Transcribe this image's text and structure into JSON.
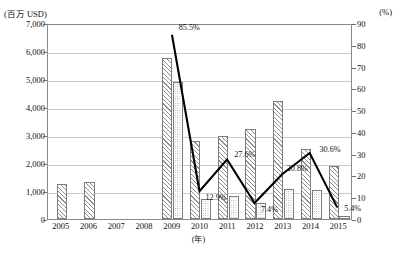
{
  "chart_data": {
    "type": "bar",
    "title": "",
    "subtitle": "",
    "xlabel": "(年)",
    "ylabel": "(百万 USD)",
    "y2label": "(%)",
    "categories": [
      "2005",
      "2006",
      "2007",
      "2008",
      "2009",
      "2010",
      "2011",
      "2012",
      "2013",
      "2014",
      "2015"
    ],
    "ylim": [
      0,
      7000
    ],
    "yticks": [
      "0",
      "1,000",
      "2,000",
      "3,000",
      "4,000",
      "5,000",
      "6,000",
      "7,000"
    ],
    "ytick_values": [
      0,
      1000,
      2000,
      3000,
      4000,
      5000,
      6000,
      7000
    ],
    "y2lim": [
      0,
      90
    ],
    "y2ticks": [
      "0",
      "10",
      "20",
      "30",
      "40",
      "50",
      "60",
      "70",
      "80",
      "90"
    ],
    "y2tick_values": [
      0,
      10,
      20,
      30,
      40,
      50,
      60,
      70,
      80,
      90
    ],
    "grid": true,
    "legend_position": "none",
    "series": [
      {
        "name": "bar-hatched",
        "kind": "bar",
        "axis": "left",
        "pattern": "diagonal-hatch",
        "values": [
          1250,
          1330,
          null,
          null,
          5750,
          2800,
          2960,
          3200,
          4200,
          2500,
          1900
        ]
      },
      {
        "name": "bar-dotted",
        "kind": "bar",
        "axis": "left",
        "pattern": "dotted",
        "values": [
          null,
          null,
          null,
          null,
          4900,
          700,
          810,
          560,
          1060,
          1050,
          120
        ]
      },
      {
        "name": "line-percent",
        "kind": "line",
        "axis": "right",
        "color": "#000000",
        "x": [
          "2009",
          "2010",
          "2011",
          "2012",
          "2013",
          "2014",
          "2015"
        ],
        "values": [
          85.5,
          12.9,
          27.6,
          7.4,
          20.8,
          30.6,
          5.4
        ],
        "data_labels": [
          "85.5%",
          "12.9%",
          "27.6%",
          "7.4%",
          "20.8%",
          "30.6%",
          "5.4%"
        ]
      }
    ]
  },
  "annotations": {
    "left_unit": "(百万 USD)",
    "right_unit": "(%)",
    "x_unit": "(年)"
  }
}
